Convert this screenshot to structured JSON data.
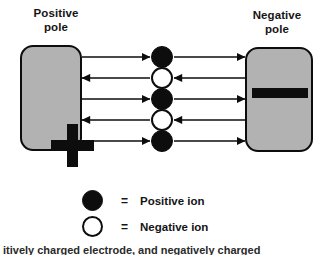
{
  "diagram": {
    "title_positive": "Positive\npole",
    "title_negative": "Negative\npole",
    "positive_symbol": "+",
    "negative_symbol": "−",
    "colors": {
      "pole_fill": "#b2b2b2",
      "outline": "#0d0d0d",
      "positive_ion_fill": "#0d0d0d",
      "negative_ion_fill": "#ffffff",
      "background": "#ffffff"
    },
    "ions": [
      {
        "type": "positive",
        "direction": "right",
        "cy": 57
      },
      {
        "type": "negative",
        "direction": "left",
        "cy": 78
      },
      {
        "type": "positive",
        "direction": "right",
        "cy": 99
      },
      {
        "type": "negative",
        "direction": "left",
        "cy": 120
      },
      {
        "type": "positive",
        "direction": "right",
        "cy": 141
      }
    ]
  },
  "legend": {
    "equals": "=",
    "items": [
      {
        "swatch": "positive",
        "label": "Positive ion"
      },
      {
        "swatch": "negative",
        "label": "Negative ion"
      }
    ]
  },
  "caption": {
    "clipped_line": "itively charged electrode, and negatively charged"
  }
}
